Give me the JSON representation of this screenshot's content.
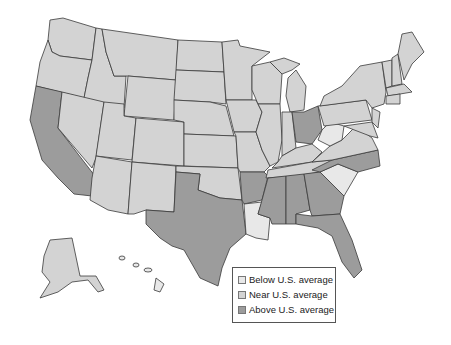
{
  "map": {
    "title": "",
    "classes": {
      "below": {
        "label": "Below U.S. average",
        "color": "#e8e8e8"
      },
      "near": {
        "label": "Near U.S. average",
        "color": "#d3d3d3"
      },
      "above": {
        "label": "Above U.S. average",
        "color": "#9c9c9c"
      }
    },
    "states_above": [
      "California",
      "Texas",
      "Arkansas",
      "Mississippi",
      "Alabama",
      "Georgia",
      "Florida",
      "North Carolina",
      "Ohio"
    ],
    "states_below": [
      "Louisiana",
      "South Carolina",
      "West Virginia",
      "Hawaii"
    ],
    "states_near": "all others"
  },
  "legend": {
    "items": [
      {
        "label": "Below U.S. average",
        "color": "#e8e8e8"
      },
      {
        "label": "Near U.S. average",
        "color": "#d3d3d3"
      },
      {
        "label": "Above U.S. average",
        "color": "#9c9c9c"
      }
    ]
  }
}
